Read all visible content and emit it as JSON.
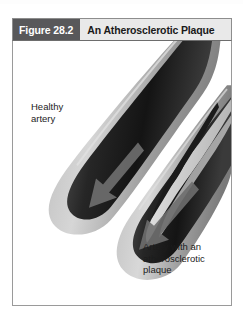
{
  "figure": {
    "number_label": "Figure 28.2",
    "title": "An Atherosclerotic Plaque",
    "labels": {
      "healthy": "Healthy\nartery",
      "diseased": "Artery with an\natherosclerotic\nplaque"
    }
  },
  "colors": {
    "number_block_bg": "#58585a",
    "number_block_text": "#ffffff",
    "title_bg": "#e9e9e9",
    "title_text": "#1a1a1a",
    "panel_bg": "#ffffff",
    "panel_border": "#9a9a9a",
    "vessel_wall_light": "#cfcfcf",
    "vessel_wall_mid": "#8f8f8f",
    "lumen_dark": "#1e1e1e",
    "plaque_light": "#d9d9d9",
    "label_text": "#1c1c1c"
  },
  "illustration": {
    "type": "grayscale-anatomical-diagram",
    "subject": "longitudinal cutaway of two curved arteries",
    "elements": [
      {
        "name": "healthy-artery",
        "description": "wide open lumen with smooth walls, blood-flow arrow pointing down-left"
      },
      {
        "name": "atherosclerotic-artery",
        "description": "lumen narrowed by irregular light-gray plaque deposit along the wall, blood-flow arrow pointing down-left"
      }
    ]
  }
}
